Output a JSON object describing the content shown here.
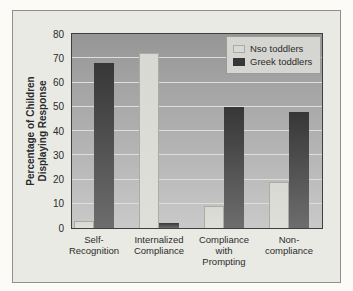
{
  "colors": {
    "page_bg": "#fcfbf8",
    "frame_bg": "#eaeae5",
    "frame_border": "#8f8f8b",
    "plot_border": "#3f3f3f",
    "plot_bg_top": "#969696",
    "plot_bg_bottom": "#c9c9c9",
    "gridline": "#dededa",
    "nso_top": "#d9d9d4",
    "nso_bottom": "#dfdfda",
    "nso_border": "#ababa6",
    "greek_top": "#373737",
    "greek_bottom": "#6d6d6d",
    "legend_bg": "#d5d5d1",
    "legend_border": "#9b9b97",
    "text": "#2b2b2b"
  },
  "chart_data": {
    "type": "bar",
    "title": "",
    "categories": [
      "Self-Recognition",
      "Internalized Compliance",
      "Compliance with Prompting",
      "Non-compliance"
    ],
    "category_labels": [
      "Self-\nRecognition",
      "Internalized\nCompliance",
      "Compliance\nwith\nPrompting",
      "Non-\ncompliance"
    ],
    "series": [
      {
        "name": "Nso toddlers",
        "values": [
          3,
          72,
          9,
          19
        ]
      },
      {
        "name": "Greek toddlers",
        "values": [
          68,
          2,
          50,
          48
        ]
      }
    ],
    "ylabel": "Percentage of Children\nDisplaying Response",
    "xlabel": "",
    "ylim": [
      0,
      80
    ],
    "ytick_step": 10,
    "yticks": [
      0,
      10,
      20,
      30,
      40,
      50,
      60,
      70,
      80
    ],
    "grid": "horizontal",
    "legend_position": "top-right"
  }
}
